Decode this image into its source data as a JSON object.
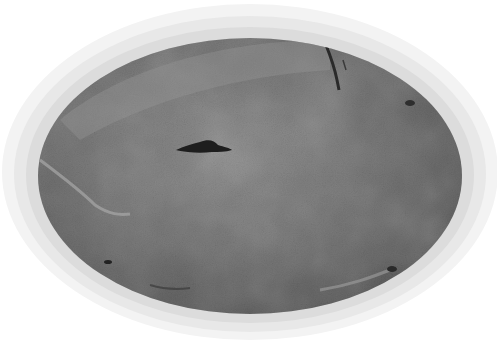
{
  "image": {
    "description": "Grayscale photograph of a weathered stone surface shown inside an oval vignette with soft gray rings",
    "subject": "rock surface with small dark hollow near center and a crack at upper right",
    "colors": {
      "background": "#ffffff",
      "outer_ring": "#f0f0f0",
      "middle_ring": "#e4e4e4",
      "inner_ring": "#d6d6d6",
      "stone_light": "#8a8a8a",
      "stone_mid": "#6e6e6e",
      "stone_dark": "#4e4e4e",
      "hollow": "#1e1e1e"
    }
  }
}
